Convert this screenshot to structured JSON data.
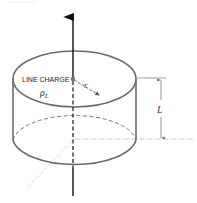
{
  "diagram": {
    "type": "gaussian-cylinder",
    "labels": {
      "line_charge": "LINE CHARGE",
      "rho": "ρ",
      "rho_sub": "L",
      "radius": "r",
      "length": "L"
    },
    "colors": {
      "outline": "#6b6b6b",
      "axis": "#111111",
      "dashed": "#555555",
      "guide": "#c8c8c8"
    }
  }
}
